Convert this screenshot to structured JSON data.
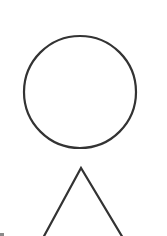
{
  "diagram": {
    "background": "#ffffff",
    "stroke_color": "#333333",
    "stroke_width": 2.2,
    "shapes": [
      {
        "id": "circle",
        "type": "circle",
        "cx": 80,
        "cy": 92,
        "r": 56,
        "fill": "none"
      },
      {
        "id": "triangle",
        "type": "triangle",
        "points": "81,168 43,238 123,238",
        "fill": "none",
        "clipped_at_bottom": true
      }
    ]
  }
}
